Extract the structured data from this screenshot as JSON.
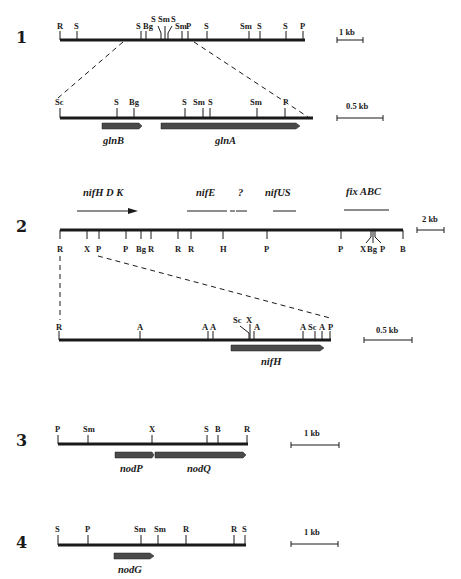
{
  "figure": {
    "panels": [
      {
        "id": "1",
        "label": "1",
        "scale": "1 kb",
        "sites": [
          "R",
          "S",
          "S",
          "Bg",
          "S",
          "Sm",
          "S",
          "Sm",
          "P",
          "S",
          "Sm",
          "S",
          "S",
          "P"
        ],
        "inset": {
          "scale": "0.5 kb",
          "sites": [
            "Sc",
            "S",
            "Bg",
            "S",
            "Sm",
            "S",
            "Sm",
            "P"
          ],
          "genes": [
            "glnB",
            "glnA"
          ]
        }
      },
      {
        "id": "2",
        "label": "2",
        "scale": "2 kb",
        "gene_regions": [
          "nifH D K",
          "nifE",
          "?",
          "nifUS",
          "fix ABC"
        ],
        "sites": [
          "R",
          "X",
          "P",
          "P",
          "Bg",
          "R",
          "R",
          "R",
          "H",
          "P",
          "P",
          "X",
          "Bg",
          "P",
          "B"
        ],
        "inset": {
          "scale": "0.5 kb",
          "sites": [
            "R",
            "A",
            "A",
            "A",
            "Sc",
            "X",
            "A",
            "A",
            "Sc",
            "A",
            "P"
          ],
          "genes": [
            "nifH"
          ]
        }
      },
      {
        "id": "3",
        "label": "3",
        "scale": "1 kb",
        "sites": [
          "P",
          "Sm",
          "X",
          "S",
          "B",
          "R"
        ],
        "genes": [
          "nodP",
          "nodQ"
        ]
      },
      {
        "id": "4",
        "label": "4",
        "scale": "1 kb",
        "sites": [
          "S",
          "P",
          "Sm",
          "Sm",
          "R",
          "R",
          "S"
        ],
        "genes": [
          "nodG"
        ]
      }
    ]
  }
}
